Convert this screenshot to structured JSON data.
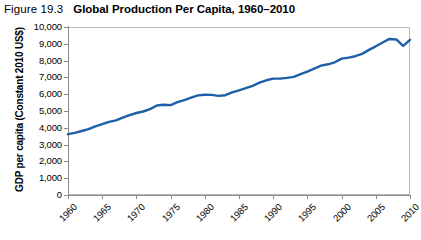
{
  "figure": {
    "number": "Figure 19.3",
    "title": "Global Production Per Capita, 1960–2010"
  },
  "colors": {
    "series_line": "#1f5fa8",
    "gridline": "#c9c9c9",
    "axis": "#8c8c8c",
    "plot_border": "#b9b9b9",
    "text": "#000000",
    "background": "#ffffff"
  },
  "chart_data": {
    "type": "line",
    "title": "Global Production Per Capita, 1960–2010",
    "xlabel": "",
    "ylabel": "GDP per capita (Constant 2010 US$)",
    "xlim": [
      1960,
      2010
    ],
    "ylim": [
      0,
      10000
    ],
    "grid": true,
    "legend": "none",
    "y_ticks": [
      0,
      1000,
      2000,
      3000,
      4000,
      5000,
      6000,
      7000,
      8000,
      9000,
      10000
    ],
    "y_tick_labels": [
      "0",
      "1,000",
      "2,000",
      "3,000",
      "4,000",
      "5,000",
      "6,000",
      "7,000",
      "8,000",
      "9,000",
      "10,000"
    ],
    "x_ticks": [
      1960,
      1965,
      1970,
      1975,
      1980,
      1985,
      1990,
      1995,
      2000,
      2005,
      2010
    ],
    "x_tick_labels": [
      "1960",
      "1965",
      "1970",
      "1975",
      "1980",
      "1985",
      "1990",
      "1995",
      "2000",
      "2005",
      "2010"
    ],
    "series": [
      {
        "name": "GDP per capita",
        "color": "#1f5fa8",
        "x": [
          1960,
          1961,
          1962,
          1963,
          1964,
          1965,
          1966,
          1967,
          1968,
          1969,
          1970,
          1971,
          1972,
          1973,
          1974,
          1975,
          1976,
          1977,
          1978,
          1979,
          1980,
          1981,
          1982,
          1983,
          1984,
          1985,
          1986,
          1987,
          1988,
          1989,
          1990,
          1991,
          1992,
          1993,
          1994,
          1995,
          1996,
          1997,
          1998,
          1999,
          2000,
          2001,
          2002,
          2003,
          2004,
          2005,
          2006,
          2007,
          2008,
          2009,
          2010
        ],
        "values": [
          3620,
          3700,
          3810,
          3920,
          4090,
          4220,
          4350,
          4440,
          4600,
          4760,
          4880,
          4970,
          5110,
          5330,
          5370,
          5350,
          5530,
          5650,
          5800,
          5930,
          5970,
          5960,
          5900,
          5940,
          6110,
          6230,
          6360,
          6500,
          6690,
          6830,
          6930,
          6930,
          6970,
          7030,
          7190,
          7350,
          7520,
          7700,
          7780,
          7900,
          8120,
          8180,
          8260,
          8400,
          8640,
          8850,
          9080,
          9290,
          9260,
          8870,
          9240
        ]
      }
    ]
  },
  "axis_titles": {
    "y": "GDP per capita (Constant 2010 US$)"
  }
}
